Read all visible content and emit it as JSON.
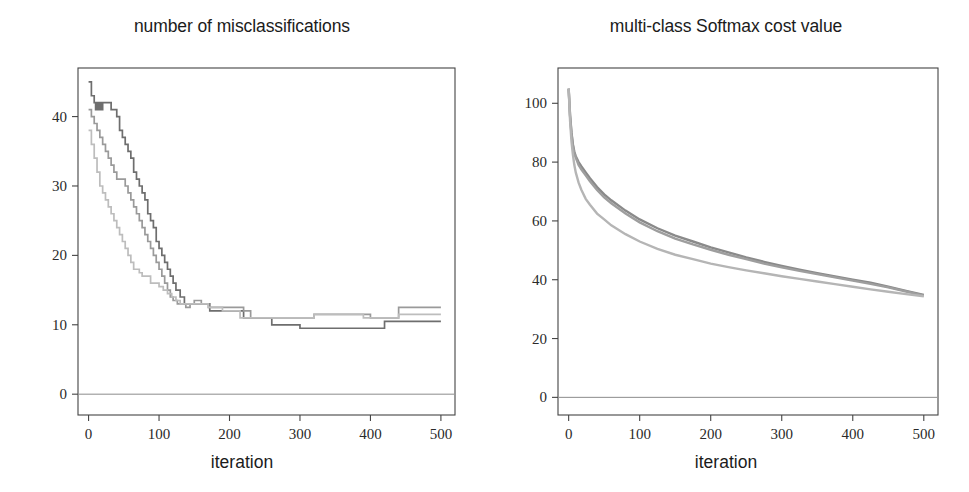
{
  "figure": {
    "width": 969,
    "height": 492,
    "background": "#ffffff"
  },
  "panels": [
    {
      "id": "misclassifications",
      "title": "number of misclassifications",
      "xlabel": "iteration"
    },
    {
      "id": "softmax-cost",
      "title": "multi-class Softmax cost value",
      "xlabel": "iteration"
    }
  ],
  "chart_data": [
    {
      "type": "line",
      "id": "misclassifications",
      "title": "number of misclassifications",
      "xlabel": "iteration",
      "ylabel": "",
      "xlim": [
        -15,
        520
      ],
      "ylim": [
        -3,
        47
      ],
      "xticks": [
        0,
        100,
        200,
        300,
        400,
        500
      ],
      "yticks": [
        0,
        10,
        20,
        30,
        40
      ],
      "grid": false,
      "legend": null,
      "colors": [
        "#6e6e6e",
        "#9a9a9a",
        "#bdbdbd"
      ],
      "series": [
        {
          "name": "run-1",
          "color": "#6e6e6e",
          "x": [
            0,
            4,
            8,
            10,
            12,
            14,
            16,
            18,
            20,
            24,
            28,
            32,
            36,
            40,
            44,
            48,
            52,
            56,
            60,
            64,
            68,
            72,
            76,
            80,
            84,
            88,
            92,
            96,
            100,
            104,
            108,
            112,
            116,
            120,
            124,
            130,
            136,
            142,
            148,
            156,
            164,
            172,
            180,
            190,
            200,
            210,
            220,
            230,
            240,
            250,
            260,
            270,
            280,
            290,
            300,
            320,
            340,
            360,
            380,
            400,
            420,
            440,
            460,
            480,
            500
          ],
          "y": [
            45,
            43,
            42,
            41,
            42,
            41,
            42,
            41,
            42,
            42,
            42,
            41,
            41,
            40,
            38,
            37,
            36,
            35,
            34,
            32,
            31,
            30,
            29,
            28,
            26,
            25,
            24,
            22,
            21,
            20,
            19,
            18,
            17,
            16,
            15,
            14,
            13,
            13,
            13,
            13,
            13,
            12,
            12,
            12,
            12,
            12,
            11,
            11,
            11,
            11,
            10,
            10,
            10,
            10,
            9.5,
            9.5,
            9.5,
            9.5,
            9.5,
            9.5,
            10.5,
            10.5,
            10.5,
            10.5,
            10.5
          ]
        },
        {
          "name": "run-2",
          "color": "#9a9a9a",
          "x": [
            0,
            4,
            8,
            12,
            16,
            20,
            24,
            28,
            32,
            36,
            40,
            44,
            48,
            52,
            56,
            60,
            64,
            68,
            72,
            76,
            80,
            84,
            88,
            92,
            96,
            100,
            104,
            108,
            112,
            116,
            120,
            126,
            132,
            138,
            144,
            150,
            160,
            170,
            180,
            190,
            200,
            210,
            220,
            230,
            240,
            250,
            260,
            270,
            280,
            290,
            300,
            310,
            320,
            340,
            360,
            380,
            400,
            420,
            430,
            440,
            460,
            480,
            500
          ],
          "y": [
            41,
            40,
            39,
            38,
            37,
            36,
            35,
            34,
            33,
            32,
            31,
            31,
            31,
            30,
            29,
            28,
            27,
            26,
            25,
            24,
            23,
            22,
            21,
            20,
            19,
            18,
            17,
            16,
            15,
            14,
            13.5,
            13,
            13,
            12.5,
            13,
            13.5,
            13,
            12.5,
            12.5,
            12.5,
            12.5,
            12.5,
            12,
            11,
            11,
            11,
            11,
            11,
            11,
            11,
            11,
            11,
            11.5,
            11.5,
            11.5,
            11.5,
            11,
            11,
            11,
            12.5,
            12.5,
            12.5,
            12.5
          ]
        },
        {
          "name": "run-3",
          "color": "#bdbdbd",
          "x": [
            0,
            4,
            8,
            12,
            16,
            20,
            24,
            28,
            32,
            36,
            40,
            44,
            48,
            52,
            56,
            60,
            64,
            68,
            72,
            76,
            80,
            84,
            88,
            92,
            96,
            100,
            106,
            112,
            118,
            124,
            130,
            136,
            142,
            150,
            160,
            170,
            180,
            190,
            200,
            210,
            215,
            220,
            230,
            240,
            250,
            260,
            270,
            280,
            290,
            300,
            310,
            320,
            340,
            360,
            380,
            390,
            400,
            420,
            440,
            460,
            480,
            500
          ],
          "y": [
            38,
            36,
            34,
            32,
            30,
            29,
            28,
            27,
            26,
            25,
            24,
            23,
            22,
            21,
            20,
            19,
            18,
            18,
            17.5,
            17,
            17,
            17,
            16,
            16,
            16,
            15.5,
            15,
            14.5,
            14,
            13.5,
            13,
            13,
            13,
            13,
            13,
            12.5,
            12.5,
            12,
            12,
            12,
            11,
            11,
            11,
            11,
            11,
            11,
            11,
            11,
            11,
            11,
            11,
            11.5,
            11.5,
            11.5,
            11.5,
            11,
            11,
            11,
            11.5,
            11.5,
            11.5,
            11.5
          ]
        }
      ]
    },
    {
      "type": "line",
      "id": "softmax-cost",
      "title": "multi-class Softmax cost value",
      "xlabel": "iteration",
      "ylabel": "",
      "xlim": [
        -15,
        520
      ],
      "ylim": [
        -6,
        112
      ],
      "xticks": [
        0,
        100,
        200,
        300,
        400,
        500
      ],
      "yticks": [
        0,
        20,
        40,
        60,
        80,
        100
      ],
      "grid": false,
      "legend": null,
      "colors": [
        "#8a8a8a",
        "#9e9e9e",
        "#b5b5b5"
      ],
      "series": [
        {
          "name": "run-1",
          "color": "#8a8a8a",
          "x": [
            0,
            2,
            4,
            6,
            8,
            10,
            14,
            18,
            24,
            30,
            40,
            50,
            60,
            80,
            100,
            125,
            150,
            175,
            200,
            225,
            250,
            275,
            300,
            325,
            350,
            375,
            400,
            425,
            450,
            475,
            500
          ],
          "y": [
            105,
            96,
            90,
            86,
            83.5,
            82,
            80,
            78.5,
            76.5,
            74.5,
            71.5,
            69,
            67,
            63.5,
            60.5,
            57.5,
            55,
            53,
            51,
            49.3,
            47.6,
            46.1,
            44.7,
            43.4,
            42.2,
            41.1,
            40.0,
            39.0,
            37.6,
            36.2,
            34.8
          ]
        },
        {
          "name": "run-2",
          "color": "#9e9e9e",
          "x": [
            0,
            2,
            4,
            6,
            8,
            10,
            14,
            18,
            24,
            30,
            40,
            50,
            60,
            80,
            100,
            125,
            150,
            175,
            200,
            225,
            250,
            275,
            300,
            325,
            350,
            375,
            400,
            425,
            450,
            475,
            500
          ],
          "y": [
            105,
            95.5,
            89.5,
            85.5,
            83,
            81.5,
            79,
            77.5,
            75.5,
            73.5,
            70.5,
            68,
            66,
            62.5,
            59.5,
            56.5,
            54,
            52,
            50.2,
            48.5,
            47,
            45.5,
            44.2,
            43,
            41.9,
            40.8,
            39.7,
            38.6,
            37.4,
            36.0,
            34.6
          ]
        },
        {
          "name": "run-3",
          "color": "#b5b5b5",
          "x": [
            0,
            2,
            4,
            6,
            8,
            10,
            14,
            18,
            24,
            30,
            40,
            50,
            60,
            80,
            100,
            125,
            150,
            175,
            200,
            225,
            250,
            275,
            300,
            325,
            350,
            375,
            400,
            425,
            450,
            475,
            500
          ],
          "y": [
            105,
            94,
            87,
            82.5,
            79,
            76.5,
            73,
            70.5,
            67.5,
            65.5,
            62.5,
            60.5,
            58.5,
            55.5,
            53,
            50.5,
            48.5,
            47,
            45.5,
            44.3,
            43.2,
            42.2,
            41.2,
            40.3,
            39.4,
            38.5,
            37.6,
            36.7,
            35.9,
            35.1,
            34.4
          ]
        }
      ]
    }
  ]
}
